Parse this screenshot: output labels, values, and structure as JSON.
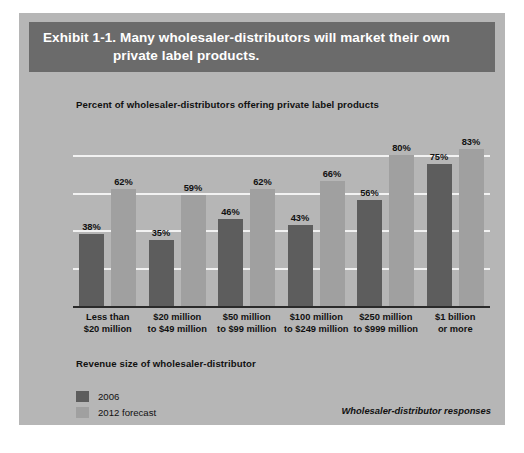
{
  "exhibit": {
    "title_line1": "Exhibit 1-1. Many wholesaler-distributors will market their own",
    "title_line2": "private label products.",
    "banner_color": "#6b6b6b",
    "panel_color": "#b6b6b6"
  },
  "axis_title": "Revenue size of wholesaler-distributor",
  "source_note": "Wholesaler-distributor responses",
  "legend": {
    "items": [
      {
        "label": "2006",
        "color": "#5d5d5d"
      },
      {
        "label": "2012 forecast",
        "color": "#a0a0a0"
      }
    ]
  },
  "chart_data": {
    "type": "bar",
    "title": "Percent of wholesaler-distributors offering private label products",
    "subtitle": "",
    "xlabel": "Revenue size of wholesaler-distributor",
    "ylabel": "",
    "ylim": [
      0,
      100
    ],
    "grid": true,
    "gridlines": [
      20,
      40,
      60,
      80
    ],
    "legend_position": "bottom-left",
    "value_suffix": "%",
    "categories": [
      "Less than\n$20 million",
      "$20 million\nto $49 million",
      "$50 million\nto $99 million",
      "$100 million\nto $249 million",
      "$250 million\nto $999 million",
      "$1 billion\nor more"
    ],
    "category_lines": [
      [
        "Less than",
        "$20 million"
      ],
      [
        "$20 million",
        "to $49 million"
      ],
      [
        "$50 million",
        "to $99 million"
      ],
      [
        "$100 million",
        "to $249 million"
      ],
      [
        "$250 million",
        "to $999 million"
      ],
      [
        "$1 billion",
        "or more"
      ]
    ],
    "series": [
      {
        "name": "2006",
        "color": "#5d5d5d",
        "values": [
          38,
          35,
          46,
          43,
          56,
          75
        ],
        "labels": [
          "38%",
          "35%",
          "46%",
          "43%",
          "56%",
          "75%"
        ]
      },
      {
        "name": "2012 forecast",
        "color": "#a0a0a0",
        "values": [
          62,
          59,
          62,
          66,
          80,
          83
        ],
        "labels": [
          "62%",
          "59%",
          "62%",
          "66%",
          "80%",
          "83%"
        ]
      }
    ]
  }
}
